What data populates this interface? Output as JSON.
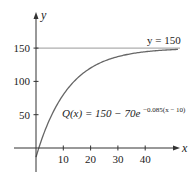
{
  "chart_data": {
    "type": "line",
    "title": "",
    "xlabel": "x",
    "ylabel": "y",
    "xlim": [
      -2,
      52
    ],
    "ylim": [
      -36,
      200
    ],
    "x_ticks": [
      10,
      20,
      30,
      40
    ],
    "x_tick_labels": [
      "10",
      "20",
      "30",
      "40"
    ],
    "y_ticks": [
      50,
      100,
      150
    ],
    "y_tick_labels": [
      "50",
      "100",
      "150"
    ],
    "grid": false,
    "series": [
      {
        "name": "Q(x)",
        "function": "150 - 70*exp(-0.085*(x-10))",
        "x_range": [
          0,
          52
        ],
        "x": [
          0,
          5,
          10,
          15,
          20,
          25,
          30,
          35,
          40,
          45,
          50,
          52
        ],
        "values": [
          -13.8,
          33.2,
          80.0,
          105.2,
          119.9,
          129.9,
          136.7,
          141.7,
          144.6,
          146.4,
          147.7,
          148.1
        ],
        "color": "#666666"
      }
    ],
    "reference_lines": [
      {
        "orientation": "horizontal",
        "y": 150,
        "label": "y = 150",
        "color": "#999999"
      }
    ],
    "annotations": [
      {
        "text_main": "Q(x) = 150 − 70e",
        "text_sup": "−0.085(x − 10)",
        "anchor_x": 10,
        "anchor_y": 55
      },
      {
        "text_main": "y = 150",
        "anchor_x": 42,
        "anchor_y": 157
      }
    ]
  }
}
